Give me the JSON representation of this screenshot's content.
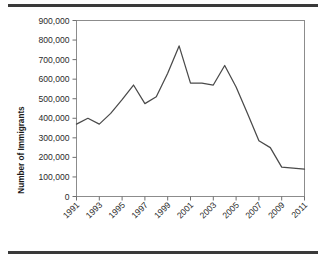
{
  "figure": {
    "top_rule_color": "#3a3a3a",
    "bottom_rule_color": "#3a3a3a",
    "background": "#ffffff"
  },
  "chart_data": {
    "type": "line",
    "title": "",
    "xlabel": "",
    "ylabel": "Number of Immigrants",
    "xlim": [
      1991,
      2011
    ],
    "ylim": [
      0,
      900000
    ],
    "grid": false,
    "legend": null,
    "line_color": "#4a4a4a",
    "y_ticks": [
      0,
      100000,
      200000,
      300000,
      400000,
      500000,
      600000,
      700000,
      800000,
      900000
    ],
    "y_tick_labels": [
      "0",
      "100,000",
      "200,000",
      "300,000",
      "400,000",
      "500,000",
      "600,000",
      "700,000",
      "800,000",
      "900,000"
    ],
    "x_ticks": [
      1991,
      1993,
      1995,
      1997,
      1999,
      2001,
      2003,
      2005,
      2007,
      2009,
      2011
    ],
    "x_tick_labels": [
      "1991",
      "1993",
      "1995",
      "1997",
      "1999",
      "2001",
      "2003",
      "2005",
      "2007",
      "2009",
      "2011"
    ],
    "x": [
      1991,
      1992,
      1993,
      1994,
      1995,
      1996,
      1997,
      1998,
      1999,
      2000,
      2001,
      2002,
      2003,
      2004,
      2005,
      2006,
      2007,
      2008,
      2009,
      2010,
      2011
    ],
    "values": [
      370000,
      400000,
      370000,
      425000,
      495000,
      570000,
      475000,
      510000,
      630000,
      770000,
      580000,
      580000,
      570000,
      670000,
      560000,
      425000,
      285000,
      250000,
      150000,
      145000,
      140000
    ],
    "series": [
      {
        "name": "Number of Immigrants",
        "values": [
          370000,
          400000,
          370000,
          425000,
          495000,
          570000,
          475000,
          510000,
          630000,
          770000,
          580000,
          580000,
          570000,
          670000,
          560000,
          425000,
          285000,
          250000,
          150000,
          145000,
          140000
        ]
      }
    ]
  }
}
